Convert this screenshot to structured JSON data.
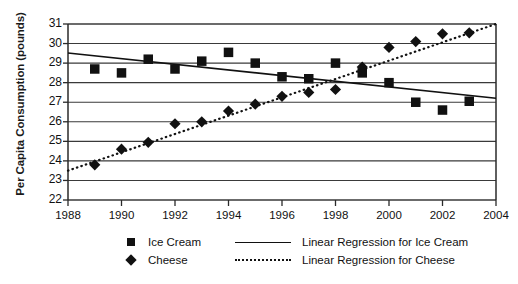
{
  "chart_data": {
    "type": "scatter",
    "title": "",
    "xlabel": "",
    "ylabel": "Per Capita Consumption (pounds)",
    "xlim": [
      1988,
      2004
    ],
    "ylim": [
      22,
      31
    ],
    "grid": true,
    "legend_position": "bottom",
    "x_ticks": [
      1988,
      1990,
      1992,
      1994,
      1996,
      1998,
      2000,
      2002,
      2004
    ],
    "y_ticks": [
      22,
      23,
      24,
      25,
      26,
      27,
      28,
      29,
      30,
      31
    ],
    "series": [
      {
        "name": "Ice Cream",
        "marker": "square",
        "color": "#111111",
        "x": [
          1989,
          1990,
          1991,
          1992,
          1993,
          1994,
          1995,
          1996,
          1997,
          1998,
          1999,
          2000,
          2001,
          2002,
          2003
        ],
        "values": [
          28.7,
          28.5,
          29.2,
          28.7,
          29.1,
          29.55,
          29.0,
          28.3,
          28.2,
          29.0,
          28.5,
          28.0,
          27.0,
          26.6,
          27.05
        ]
      },
      {
        "name": "Cheese",
        "marker": "diamond",
        "color": "#111111",
        "x": [
          1989,
          1990,
          1991,
          1992,
          1993,
          1994,
          1995,
          1996,
          1997,
          1998,
          1999,
          2000,
          2001,
          2002,
          2003
        ],
        "values": [
          23.8,
          24.6,
          24.95,
          25.9,
          26.0,
          26.55,
          26.9,
          27.3,
          27.5,
          27.65,
          28.8,
          29.8,
          30.1,
          30.5,
          30.55
        ]
      }
    ],
    "trendlines": [
      {
        "name": "Linear Regression for Ice Cream",
        "style": "solid",
        "color": "#111111",
        "x": [
          1988,
          2004
        ],
        "values": [
          29.52,
          27.2
        ]
      },
      {
        "name": "Linear Regression for Cheese",
        "style": "dotted",
        "color": "#111111",
        "x": [
          1988,
          2004
        ],
        "values": [
          23.5,
          31.0
        ]
      }
    ]
  },
  "legend": {
    "entries": [
      {
        "label": "Ice Cream",
        "marker": "square-marker"
      },
      {
        "label": "Cheese",
        "marker": "diamond-marker"
      }
    ],
    "line_entries": [
      {
        "label": "Linear Regression for Ice Cream",
        "style": "solid-line"
      },
      {
        "label": "Linear Regression for Cheese",
        "style": "dotted-line"
      }
    ]
  }
}
